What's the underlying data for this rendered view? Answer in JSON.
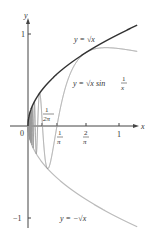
{
  "chart_data": {
    "type": "line",
    "title": "",
    "xlabel": "x",
    "ylabel": "y",
    "xlim": [
      0,
      1
    ],
    "ylim": [
      -1,
      1
    ],
    "grid": false,
    "x_ticks": [
      {
        "value": 0.1592,
        "label": "1/(2π)"
      },
      {
        "value": 0.3183,
        "label": "1/π"
      },
      {
        "value": 0.6366,
        "label": "2/π"
      },
      {
        "value": 1,
        "label": "1"
      }
    ],
    "y_ticks": [
      {
        "value": 1,
        "label": "1"
      },
      {
        "value": -1,
        "label": "−1"
      }
    ],
    "origin_label": "0",
    "series": [
      {
        "name": "y = √x",
        "function": "sqrt(x)",
        "color": "#333333"
      },
      {
        "name": "y = √x sin(1/x)",
        "function": "sqrt(x)*sin(1/x)",
        "color": "#999999"
      },
      {
        "name": "y = −√x",
        "function": "-sqrt(x)",
        "color": "#bbbbbb"
      }
    ],
    "annotations": [
      {
        "text": "y = √x",
        "near": [
          0.6,
          0.85
        ]
      },
      {
        "text": "y = √x sin 1/x",
        "near": [
          0.6,
          0.4
        ]
      },
      {
        "text": "y = −√x",
        "near": [
          0.5,
          -0.95
        ]
      }
    ]
  },
  "labels": {
    "y_axis": "y",
    "x_axis": "x",
    "origin": "0",
    "y_one": "1",
    "y_neg_one": "−1",
    "x_one": "1",
    "tick_one": "1",
    "pi": "π",
    "two": "2",
    "two_pi": "2π",
    "curve_sqrt": "y = √x",
    "curve_sin_prefix": "y = √x sin",
    "curve_neg": "y = −√x"
  }
}
